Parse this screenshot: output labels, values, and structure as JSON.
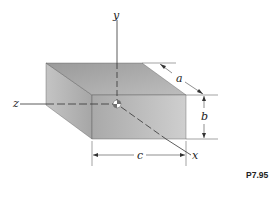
{
  "figure": {
    "type": "rectangular-prism-with-axes",
    "problem_label": "P7.95",
    "axes": {
      "x_label": "x",
      "y_label": "y",
      "z_label": "z"
    },
    "dimensions": {
      "depth_label": "a",
      "height_label": "b",
      "width_label": "c"
    },
    "centroid_marker": "center-of-mass-symbol",
    "colors": {
      "front_face": "#b4b4b4",
      "top_face": "#a8a8a8",
      "side_face": "#bcbcbc",
      "lines": "#333333"
    }
  }
}
